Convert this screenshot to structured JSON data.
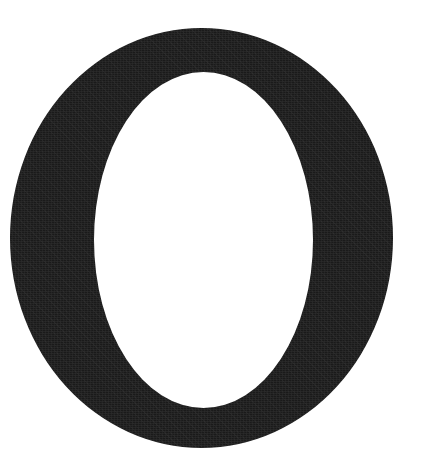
{
  "image": {
    "kind": "letterform-scan",
    "width": 422,
    "height": 466,
    "background_color": "#ffffff",
    "ink_color": "#1a1a1a",
    "description": "Large black capital letter O on a plain white background"
  },
  "glyph": {
    "character": "O",
    "name": "capital-letter-o",
    "style": "serif-roman-capital",
    "stress": "vertical",
    "color": "#1a1a1a",
    "outer": {
      "left": 10,
      "top": 28,
      "right": 393,
      "bottom": 448,
      "center_x": 201.5,
      "center_y": 238,
      "radius_x": 191.5,
      "radius_y": 210
    },
    "counter": {
      "left": 94,
      "top": 72,
      "right": 313,
      "bottom": 408,
      "center_x": 203.5,
      "center_y": 240,
      "radius_x": 109.5,
      "radius_y": 168
    },
    "stroke_widths": {
      "left_side": 84,
      "right_side": 80,
      "top": 44,
      "bottom": 40
    }
  },
  "labels": {
    "alt_text": "Capital letter O"
  }
}
